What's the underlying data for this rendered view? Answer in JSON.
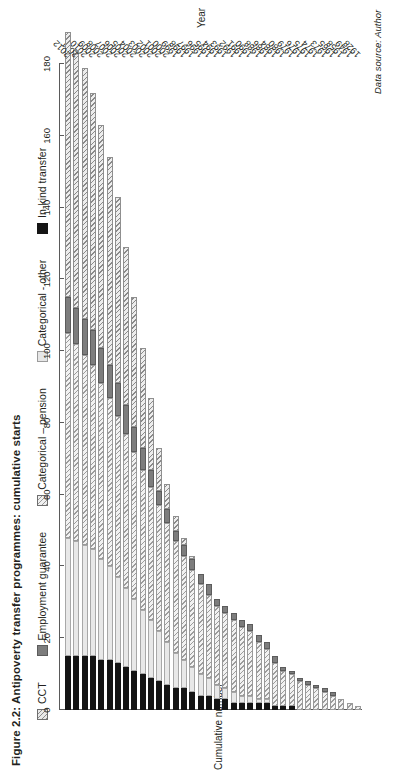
{
  "figure": {
    "title": "Figure 2.2: Antipoverty transfer programmes: cumulative starts",
    "source_note": "Data source: Author"
  },
  "chart_data": {
    "type": "bar",
    "orientation": "horizontal-stacked",
    "title": "Figure 2.2: Antipoverty transfer programmes: cumulative starts",
    "xlabel": "Year",
    "ylabel": "Cumulative number",
    "ylim": [
      0,
      180
    ],
    "yticks": [
      0,
      20,
      40,
      60,
      80,
      100,
      120,
      140,
      160,
      180
    ],
    "ytick_labels": [
      "0",
      "20",
      "40",
      "60",
      "80",
      "100",
      "120",
      "140",
      "160",
      "180"
    ],
    "grid": false,
    "legend_position": "top",
    "legend": [
      "CCT",
      "Employment guarantee",
      "Categorical – pension",
      "Categorical - other",
      "In-kind transfer"
    ],
    "categories": [
      "1928",
      "1949",
      "1958",
      "1965",
      "1973",
      "1974",
      "1975",
      "1976",
      "1979",
      "1980",
      "1984",
      "1986",
      "1988",
      "1990",
      "1991",
      "1992",
      "1993",
      "1994",
      "1995",
      "1996",
      "1997",
      "1998",
      "1999",
      "2000",
      "2001",
      "2002",
      "2003",
      "2004",
      "2005",
      "2006",
      "2007",
      "2008",
      "2009",
      "2010",
      "2011",
      "2012"
    ],
    "series": [
      {
        "name": "CCT",
        "key": "cct",
        "values": [
          0,
          0,
          0,
          0,
          0,
          0,
          0,
          0,
          0,
          0,
          0,
          0,
          0,
          0,
          0,
          0,
          0,
          0,
          0,
          0,
          1,
          2,
          4,
          7,
          12,
          20,
          28,
          36,
          44,
          52,
          58,
          62,
          66,
          70,
          72,
          74
        ]
      },
      {
        "name": "Employment guarantee",
        "key": "emp",
        "values": [
          0,
          0,
          0,
          1,
          1,
          1,
          1,
          1,
          1,
          1,
          2,
          2,
          2,
          2,
          2,
          2,
          2,
          2,
          3,
          3,
          3,
          3,
          3,
          4,
          4,
          5,
          6,
          7,
          8,
          9,
          9,
          10,
          10,
          10,
          10,
          10
        ]
      },
      {
        "name": "Categorical – pension",
        "key": "pen",
        "values": [
          1,
          2,
          3,
          4,
          5,
          6,
          7,
          8,
          9,
          10,
          12,
          14,
          16,
          18,
          19,
          20,
          21,
          22,
          23,
          25,
          27,
          29,
          31,
          33,
          35,
          37,
          39,
          41,
          43,
          45,
          47,
          49,
          51,
          53,
          55,
          57
        ]
      },
      {
        "name": "Categorical - other",
        "key": "oth",
        "values": [
          0,
          0,
          0,
          0,
          0,
          0,
          0,
          0,
          0,
          0,
          0,
          1,
          1,
          2,
          2,
          3,
          3,
          4,
          5,
          6,
          7,
          8,
          10,
          12,
          14,
          16,
          18,
          20,
          22,
          24,
          26,
          28,
          30,
          31,
          32,
          33
        ]
      },
      {
        "name": "In-kind transfer",
        "key": "ink",
        "values": [
          0,
          0,
          0,
          0,
          0,
          0,
          0,
          0,
          1,
          1,
          1,
          2,
          2,
          2,
          2,
          2,
          3,
          3,
          4,
          4,
          5,
          6,
          6,
          7,
          8,
          9,
          10,
          11,
          12,
          13,
          14,
          14,
          15,
          15,
          15,
          15
        ]
      }
    ]
  },
  "legend_items": [
    {
      "label": "CCT",
      "swatch": "cct-swatch"
    },
    {
      "label": "Employment guarantee",
      "swatch": "employment-guarantee-swatch"
    },
    {
      "label": "Categorical – pension",
      "swatch": "categorical-pension-swatch"
    },
    {
      "label": "Categorical - other",
      "swatch": "categorical-other-swatch"
    },
    {
      "label": "In-kind transfer",
      "swatch": "in-kind-transfer-swatch"
    }
  ]
}
